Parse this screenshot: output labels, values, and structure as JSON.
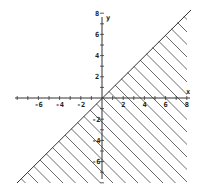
{
  "chart_data": {
    "type": "diagram",
    "title": "",
    "boundary_line": {
      "equation": "y = x",
      "from": [
        -8,
        -8
      ],
      "to": [
        8,
        8
      ],
      "style": "solid"
    },
    "shaded_region": {
      "inequality": "y <= x",
      "fill": "diagonal-hatch",
      "vertices": [
        [
          -8,
          -8
        ],
        [
          8,
          8
        ],
        [
          8,
          -8
        ]
      ]
    },
    "xlabel": "x",
    "ylabel": "y",
    "xlim": [
      -8,
      8
    ],
    "ylim": [
      -8,
      8
    ],
    "x_tick_labels": [
      "-6",
      "-4",
      "-2",
      "2",
      "4",
      "6",
      "8"
    ],
    "y_tick_labels": [
      "8",
      "6",
      "4",
      "2",
      "-2",
      "-4",
      "-6"
    ],
    "grid": false
  },
  "axes": {
    "x_label": "x",
    "y_label": "y",
    "x_ticks": [
      {
        "value": -6,
        "label": "-6"
      },
      {
        "value": -4,
        "label": "-4"
      },
      {
        "value": -2,
        "label": "-2"
      },
      {
        "value": 2,
        "label": "2"
      },
      {
        "value": 4,
        "label": "4"
      },
      {
        "value": 6,
        "label": "6"
      },
      {
        "value": 8,
        "label": "8"
      }
    ],
    "y_ticks": [
      {
        "value": 8,
        "label": "8"
      },
      {
        "value": 6,
        "label": "6"
      },
      {
        "value": 4,
        "label": "4"
      },
      {
        "value": 2,
        "label": "2"
      },
      {
        "value": -2,
        "label": "-2"
      },
      {
        "value": -4,
        "label": "-4"
      },
      {
        "value": -6,
        "label": "-6"
      }
    ]
  },
  "colors": {
    "ink": "#333333",
    "background": "#ffffff"
  }
}
